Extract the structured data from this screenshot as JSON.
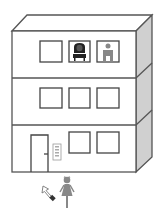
{
  "scene": {
    "title": "Apartment building with intercom",
    "colors": {
      "outline": "#555555",
      "side_fill": "#d0d0d0",
      "front_fill": "#ffffff",
      "figure_gray": "#888888",
      "figure_dark": "#222222"
    }
  },
  "building": {
    "floors": [
      {
        "level": 3,
        "windows": [
          {
            "id": "w3-1",
            "occupant": "none"
          },
          {
            "id": "w3-2",
            "occupant": "woman-dark-icon"
          },
          {
            "id": "w3-3",
            "occupant": "man-gray-icon"
          }
        ]
      },
      {
        "level": 2,
        "windows": [
          {
            "id": "w2-1",
            "occupant": "none"
          },
          {
            "id": "w2-2",
            "occupant": "none"
          },
          {
            "id": "w2-3",
            "occupant": "none"
          }
        ]
      },
      {
        "level": 1,
        "door": "entrance-door",
        "intercom": "intercom-panel",
        "windows": [
          {
            "id": "w1-2",
            "occupant": "none"
          },
          {
            "id": "w1-3",
            "occupant": "none"
          }
        ]
      }
    ]
  },
  "outside": {
    "visitor": "woman-visitor-icon",
    "pointer": "mouse-cursor-icon"
  }
}
